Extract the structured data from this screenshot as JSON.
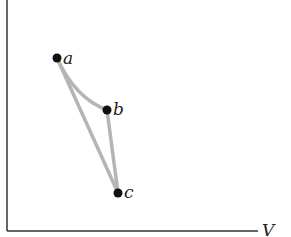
{
  "diagram": {
    "type": "pv-cycle",
    "axes": {
      "y_label": "P",
      "x_label": "V"
    },
    "points": [
      {
        "id": "a",
        "label": "a",
        "x": 57,
        "y": 58
      },
      {
        "id": "b",
        "label": "b",
        "x": 107,
        "y": 110
      },
      {
        "id": "c",
        "label": "c",
        "x": 118,
        "y": 193
      }
    ],
    "paths": [
      {
        "from": "a",
        "to": "b",
        "shape": "curve"
      },
      {
        "from": "b",
        "to": "c",
        "shape": "straight"
      },
      {
        "from": "c",
        "to": "a",
        "shape": "straight"
      }
    ],
    "colors": {
      "axis": "#333333",
      "path": "#b5b5b5",
      "point": "#111111"
    }
  }
}
